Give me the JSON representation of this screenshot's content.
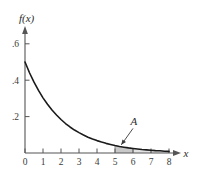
{
  "chart_data": {
    "type": "line",
    "title": "",
    "subtitle": "",
    "xlabel": "x",
    "ylabel": "f(x)",
    "xlim": [
      0,
      8.3
    ],
    "ylim": [
      0,
      0.68
    ],
    "grid": false,
    "legend": null,
    "x_ticks": [
      {
        "value": 0,
        "label": "0"
      },
      {
        "value": 1,
        "label": "1"
      },
      {
        "value": 2,
        "label": "2"
      },
      {
        "value": 3,
        "label": "3"
      },
      {
        "value": 4,
        "label": "4"
      },
      {
        "value": 5,
        "label": "5"
      },
      {
        "value": 6,
        "label": "6"
      },
      {
        "value": 7,
        "label": "7"
      },
      {
        "value": 8,
        "label": "8"
      }
    ],
    "y_ticks": [
      {
        "value": 0.2,
        "label": ".2"
      },
      {
        "value": 0.4,
        "label": ".4"
      },
      {
        "value": 0.6,
        "label": ".6"
      }
    ],
    "series": [
      {
        "name": "f(x)",
        "type": "line",
        "color": "#1a1a1a",
        "x": [
          0,
          0.25,
          0.5,
          0.75,
          1,
          1.25,
          1.5,
          1.75,
          2,
          2.25,
          2.5,
          2.75,
          3,
          3.25,
          3.5,
          3.75,
          4,
          4.25,
          4.5,
          4.75,
          5,
          5.25,
          5.5,
          5.75,
          6,
          6.25,
          6.5,
          6.75,
          7,
          7.25,
          7.5,
          7.75,
          8
        ],
        "values": [
          0.5,
          0.441,
          0.389,
          0.344,
          0.303,
          0.268,
          0.236,
          0.209,
          0.184,
          0.162,
          0.143,
          0.126,
          0.112,
          0.099,
          0.087,
          0.077,
          0.068,
          0.06,
          0.053,
          0.047,
          0.041,
          0.036,
          0.032,
          0.028,
          0.025,
          0.022,
          0.019,
          0.017,
          0.015,
          0.013,
          0.012,
          0.01,
          0.009
        ]
      }
    ],
    "shaded_regions": [
      {
        "label": "A",
        "x_start": 5,
        "x_end": 6,
        "fill": "#c8c8c8",
        "emphasis": "primary"
      },
      {
        "label": "",
        "x_start": 6,
        "x_end": 8,
        "fill": "#e2e2e2",
        "emphasis": "secondary"
      }
    ],
    "annotations": [
      {
        "text": "A",
        "x": 6.05,
        "y": 0.155,
        "leader_from_x": 6.0,
        "leader_from_y": 0.135,
        "leader_to_x": 5.35,
        "leader_to_y": 0.045,
        "style": "italic"
      }
    ]
  },
  "figure": {
    "y_axis_label": "f(x)",
    "x_axis_label": "x",
    "region_label": "A",
    "axis_color": "#555555",
    "curve_color": "#1a1a1a",
    "shade_primary_color": "#c8c8c8",
    "shade_secondary_color": "#e2e2e2",
    "background": "#ffffff"
  }
}
